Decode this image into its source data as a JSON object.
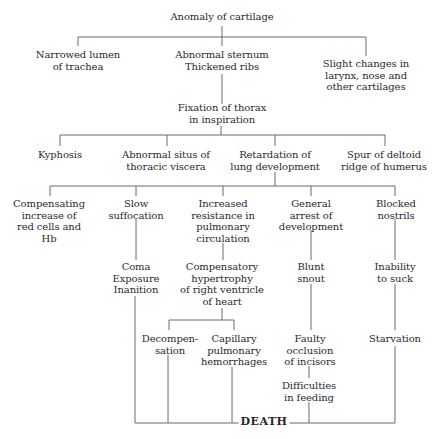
{
  "diagram": {
    "root": {
      "id": "anomaly",
      "lines": [
        "Anomaly of cartilage"
      ]
    },
    "level1": [
      {
        "id": "narrowed-lumen",
        "lines": [
          "Narrowed lumen",
          "of trachea"
        ]
      },
      {
        "id": "abnormal-sternum",
        "lines": [
          "Abnormal sternum",
          "Thickened ribs"
        ]
      },
      {
        "id": "slight-changes",
        "lines": [
          "Slight changes in",
          "larynx, nose and",
          "other cartilages"
        ]
      }
    ],
    "fixation": {
      "id": "fixation",
      "lines": [
        "Fixation of thorax",
        "in inspiration"
      ]
    },
    "level2": [
      {
        "id": "kyphosis",
        "lines": [
          "Kyphosis"
        ]
      },
      {
        "id": "abnormal-situs",
        "lines": [
          "Abnormal situs of",
          "thoracic viscera"
        ]
      },
      {
        "id": "retardation",
        "lines": [
          "Retardation of",
          "lung development"
        ]
      },
      {
        "id": "spur",
        "lines": [
          "Spur of deltoid",
          "ridge of humerus"
        ]
      }
    ],
    "level3": [
      {
        "id": "compensating",
        "lines": [
          "Compensating",
          "increase of",
          "red cells and",
          "Hb"
        ]
      },
      {
        "id": "slow-suffocation",
        "lines": [
          "Slow",
          "suffocation"
        ]
      },
      {
        "id": "increased-resistance",
        "lines": [
          "Increased",
          "resistance in",
          "pulmonary",
          "circulation"
        ]
      },
      {
        "id": "general-arrest",
        "lines": [
          "General",
          "arrest of",
          "development"
        ]
      },
      {
        "id": "blocked-nostrils",
        "lines": [
          "Blocked",
          "nostrils"
        ]
      }
    ],
    "level4": [
      {
        "id": "coma",
        "lines": [
          "Coma",
          "Exposure",
          "Inanition"
        ]
      },
      {
        "id": "compensatory-hypertrophy",
        "lines": [
          "Compensatory",
          "hypertrophy",
          "of right ventricle",
          "of heart"
        ]
      },
      {
        "id": "blunt-snout",
        "lines": [
          "Blunt",
          "snout"
        ]
      },
      {
        "id": "inability",
        "lines": [
          "Inability",
          "to suck"
        ]
      }
    ],
    "level5": [
      {
        "id": "decompensation",
        "lines": [
          "Decompen-",
          "sation"
        ]
      },
      {
        "id": "capillary",
        "lines": [
          "Capillary",
          "pulmonary",
          "hemorrhages"
        ]
      },
      {
        "id": "faulty-occlusion",
        "lines": [
          "Faulty",
          "occlusion",
          "of incisors"
        ]
      },
      {
        "id": "starvation",
        "lines": [
          "Starvation"
        ]
      }
    ],
    "difficulties": {
      "id": "difficulties",
      "lines": [
        "Difficulties",
        "in feeding"
      ]
    },
    "terminal": {
      "id": "death",
      "label": "DEATH"
    }
  },
  "colors": {
    "line": "#6a6a6a",
    "text": "#2a2a2a",
    "background": "#ffffff"
  }
}
